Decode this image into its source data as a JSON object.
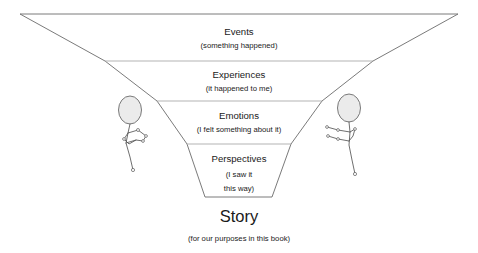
{
  "diagram": {
    "type": "funnel",
    "tiers": [
      {
        "id": "events",
        "label": "Events",
        "subtitle": "(something happened)",
        "subtitle_lines": [
          "(something happened)"
        ]
      },
      {
        "id": "experiences",
        "label": "Experiences",
        "subtitle": "(it happened to me)",
        "subtitle_lines": [
          "(it happened to me)"
        ]
      },
      {
        "id": "emotions",
        "label": "Emotions",
        "subtitle": "(I felt something about it)",
        "subtitle_lines": [
          "(I felt something about it)"
        ]
      },
      {
        "id": "perspectives",
        "label": "Perspectives",
        "subtitle": "(I saw it this way)",
        "subtitle_lines": [
          "(I saw it",
          "this way)"
        ]
      }
    ],
    "outcome": {
      "label": "Story",
      "subtitle": "(for our purposes in this book)"
    },
    "figures": [
      {
        "id": "left-person",
        "name": "stick-figure-left"
      },
      {
        "id": "right-person",
        "name": "stick-figure-right"
      }
    ],
    "colors": {
      "outline": "#6b6b6b",
      "divider": "#aaaaaa",
      "figure": "#555555",
      "head_fill": "#ebebeb",
      "text": "#1a1a1a",
      "background": "#ffffff"
    }
  }
}
